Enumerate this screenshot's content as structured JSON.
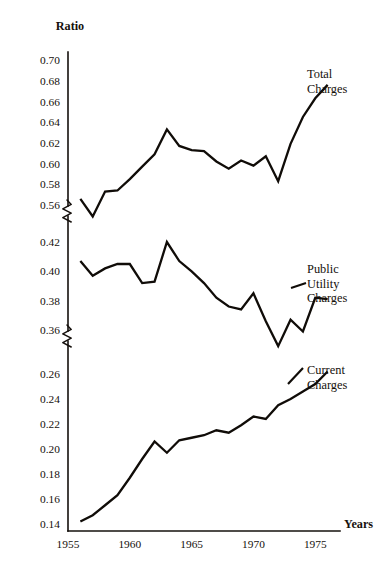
{
  "chart_data": {
    "type": "line",
    "title": "",
    "ylabel": "Ratio",
    "xlabel": "Years",
    "grid": false,
    "legend_position": "inline-right-annotations",
    "x": [
      1956,
      1957,
      1958,
      1959,
      1960,
      1961,
      1962,
      1963,
      1964,
      1965,
      1966,
      1967,
      1968,
      1969,
      1970,
      1971,
      1972,
      1973,
      1974,
      1975,
      1976
    ],
    "xlim": [
      1955,
      1977
    ],
    "xticks": [
      1955,
      1960,
      1965,
      1970,
      1975
    ],
    "xtick_labels": [
      "1955",
      "1960",
      "1965",
      "1970",
      "1975"
    ],
    "y_axis_broken": true,
    "y_segments": [
      {
        "name": "upper",
        "range": [
          0.56,
          0.7
        ],
        "ticks": [
          0.56,
          0.58,
          0.6,
          0.62,
          0.64,
          0.66,
          0.68,
          0.7
        ],
        "tick_labels": [
          "0.56",
          "0.58",
          "0.60",
          "0.62",
          "0.64",
          "0.66",
          "0.68",
          "0.70"
        ]
      },
      {
        "name": "middle",
        "range": [
          0.36,
          0.42
        ],
        "ticks": [
          0.36,
          0.38,
          0.4,
          0.42
        ],
        "tick_labels": [
          "0.36",
          "0.38",
          "0.40",
          "0.42"
        ]
      },
      {
        "name": "lower",
        "range": [
          0.14,
          0.26
        ],
        "ticks": [
          0.14,
          0.16,
          0.18,
          0.2,
          0.22,
          0.24,
          0.26
        ],
        "tick_labels": [
          "0.14",
          "0.16",
          "0.18",
          "0.20",
          "0.22",
          "0.24",
          "0.26"
        ]
      }
    ],
    "series": [
      {
        "name": "Total Charges",
        "label_lines": [
          "Total",
          "Charges"
        ],
        "segment": "upper",
        "values": [
          0.566,
          0.549,
          0.573,
          0.574,
          0.585,
          0.597,
          0.609,
          0.633,
          0.617,
          0.613,
          0.612,
          0.602,
          0.595,
          0.603,
          0.598,
          0.607,
          0.583,
          0.619,
          0.645,
          0.663,
          0.676
        ]
      },
      {
        "name": "Public Utility Charges",
        "label_lines": [
          "Public",
          "Utility",
          "Charges"
        ],
        "segment": "middle",
        "values": [
          0.407,
          0.397,
          0.402,
          0.405,
          0.405,
          0.392,
          0.393,
          0.42,
          0.407,
          0.4,
          0.392,
          0.382,
          0.376,
          0.374,
          0.385,
          0.366,
          0.349,
          0.367,
          0.359,
          0.382,
          0.381
        ]
      },
      {
        "name": "Current Charges",
        "label_lines": [
          "Current",
          "Charges"
        ],
        "segment": "lower",
        "values": [
          0.142,
          0.147,
          0.155,
          0.163,
          0.177,
          0.192,
          0.206,
          0.197,
          0.207,
          0.209,
          0.211,
          0.215,
          0.213,
          0.219,
          0.226,
          0.224,
          0.235,
          0.24,
          0.246,
          0.252,
          0.262
        ]
      }
    ]
  },
  "axis": {
    "y_title": "Ratio",
    "x_title": "Years"
  }
}
